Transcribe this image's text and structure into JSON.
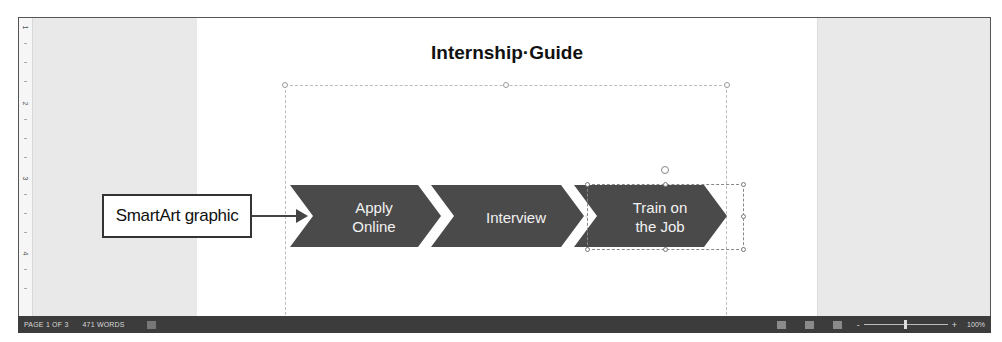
{
  "document": {
    "title": "Internship·Guide"
  },
  "ruler": {
    "marks": [
      "1",
      "2",
      "3",
      "4"
    ]
  },
  "smartart": {
    "type": "Basic Chevron Process",
    "fill_color": "#4a4a4a",
    "text_color": "#f2f2f2",
    "steps": [
      {
        "label_line1": "Apply",
        "label_line2": "Online"
      },
      {
        "label_line1": "Interview",
        "label_line2": ""
      },
      {
        "label_line1": "Train on",
        "label_line2": "the Job"
      }
    ],
    "selected_step": 2
  },
  "callout": {
    "label": "SmartArt graphic"
  },
  "status_bar": {
    "page": "PAGE 1 OF 3",
    "words": "471 WORDS",
    "zoom_minus": "-",
    "zoom_plus": "+",
    "zoom_level": "100%"
  }
}
